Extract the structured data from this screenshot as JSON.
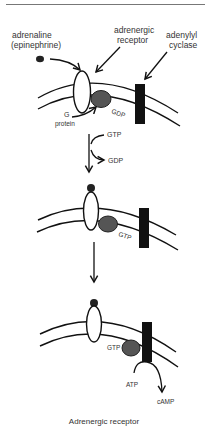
{
  "labels": {
    "adrenaline": "adrenaline",
    "epinephrine": "(epinephrine)",
    "receptor_line1": "adrenergic",
    "receptor_line2": "receptor",
    "cyclase_line1": "adenylyl",
    "cyclase_line2": "cyclase",
    "gdp_bound": "GDP",
    "g_line1": "G",
    "g_line2": "protein",
    "gtp_in": "GTP",
    "gdp_out": "GDP",
    "gtp_bound_2": "GTP",
    "gtp_bound_3": "GTP",
    "atp": "ATP",
    "camp": "cAMP"
  },
  "caption": "Adrenergic receptor",
  "colors": {
    "stroke": "#111111",
    "g_protein": "#555555",
    "cyclase": "#111111",
    "ligand": "#222222"
  }
}
